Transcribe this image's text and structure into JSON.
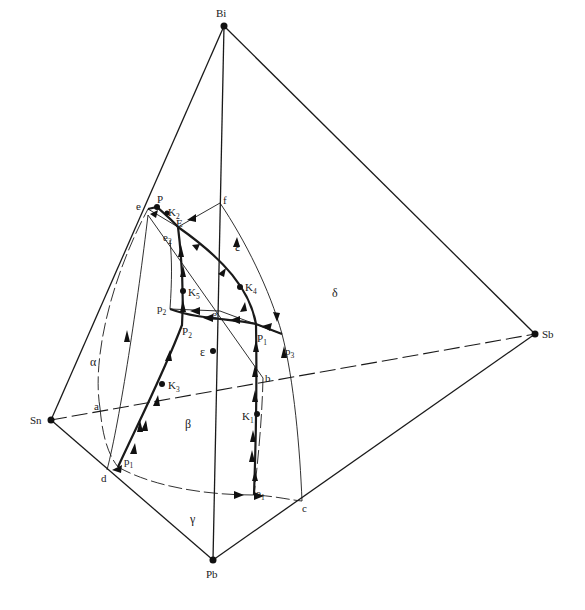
{
  "diagram": {
    "vertices": [
      {
        "id": "Bi",
        "label": "Bi",
        "x": 224,
        "y": 26
      },
      {
        "id": "Sn",
        "label": "Sn",
        "x": 51,
        "y": 420
      },
      {
        "id": "Pb",
        "label": "Pb",
        "x": 213,
        "y": 560
      },
      {
        "id": "Sb",
        "label": "Sb",
        "x": 535,
        "y": 334
      }
    ],
    "phase_fields": [
      {
        "label": "α",
        "x": 96,
        "y": 362
      },
      {
        "label": "β",
        "x": 188,
        "y": 424
      },
      {
        "label": "γ",
        "x": 192,
        "y": 520
      },
      {
        "label": "δ",
        "x": 335,
        "y": 294
      },
      {
        "label": "ε",
        "x": 237,
        "y": 249
      },
      {
        "label": "ε",
        "x": 199,
        "y": 352
      }
    ],
    "points": {
      "a": {
        "label": "a",
        "x": 100,
        "y": 408
      },
      "b": {
        "label": "b",
        "x": 263,
        "y": 378
      },
      "c": {
        "label": "c",
        "x": 302,
        "y": 501
      },
      "d": {
        "label": "d",
        "x": 107,
        "y": 470
      },
      "e": {
        "label": "e",
        "x": 148,
        "y": 209
      },
      "f": {
        "label": "f",
        "x": 220,
        "y": 203
      },
      "g": {
        "label": "g",
        "x": 220,
        "y": 311
      },
      "E": {
        "label": "E",
        "x": 178,
        "y": 227
      },
      "P": {
        "label": "P",
        "x": 157,
        "y": 207
      },
      "e1": {
        "label": "e",
        "sub": "1",
        "x": 254,
        "y": 495
      },
      "e2": {
        "label": "e",
        "sub": "2",
        "x": 168,
        "y": 240
      },
      "p1": {
        "label": "p",
        "sub": "1",
        "x": 118,
        "y": 467
      },
      "p2": {
        "label": "p",
        "sub": "2",
        "x": 170,
        "y": 309
      },
      "p3": {
        "label": "p",
        "sub": "3",
        "x": 282,
        "y": 334
      },
      "P1": {
        "label": "P",
        "sub": "1",
        "x": 256,
        "y": 324
      },
      "P2": {
        "label": "P",
        "sub": "2",
        "x": 182,
        "y": 325
      },
      "K1": {
        "label": "K",
        "sub": "1",
        "x": 257,
        "y": 414
      },
      "K2": {
        "label": "K",
        "sub": "2",
        "x": 167,
        "y": 213
      },
      "K3": {
        "label": "K",
        "sub": "3",
        "x": 162,
        "y": 384
      },
      "K4": {
        "label": "K",
        "sub": "4",
        "x": 240,
        "y": 287
      },
      "K5": {
        "label": "K",
        "sub": "5",
        "x": 183,
        "y": 291
      }
    }
  }
}
